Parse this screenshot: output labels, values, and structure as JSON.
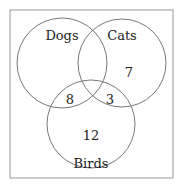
{
  "diagram": {
    "type": "venn",
    "sets": [
      {
        "label": "Dogs"
      },
      {
        "label": "Cats"
      },
      {
        "label": "Birds"
      }
    ],
    "regions": {
      "cats_only": "7",
      "dogs_birds": "8",
      "cats_birds": "3",
      "birds_only": "12"
    },
    "colors": {
      "stroke": "#777777",
      "border": "#999999",
      "text": "#222222"
    }
  }
}
